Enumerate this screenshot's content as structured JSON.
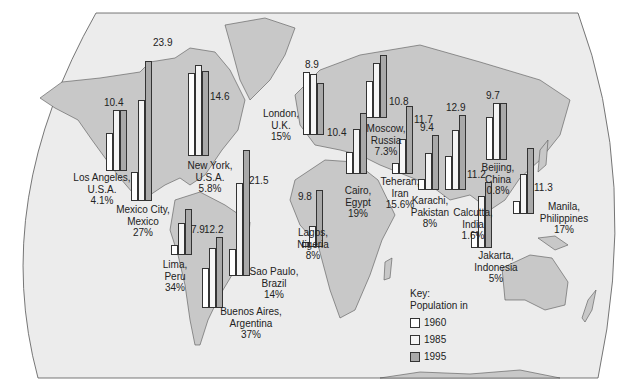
{
  "key": {
    "title": "Key:",
    "subtitle": "Population in",
    "items": [
      {
        "year": "1960",
        "color": "#ffffff"
      },
      {
        "year": "1985",
        "color": "#f4f4f4"
      },
      {
        "year": "1995",
        "color": "#a9a9a9"
      }
    ]
  },
  "cities": [
    {
      "name": "Los Angeles,",
      "country": "U.S.A.",
      "pct": "4.1%",
      "value_1995": "10.4"
    },
    {
      "name": "Mexico City,",
      "country": "Mexico",
      "pct": "27%",
      "value_1995": "23.9"
    },
    {
      "name": "New York,",
      "country": "U.S.A.",
      "pct": "5.8%",
      "value_1995": "14.6"
    },
    {
      "name": "Lima,",
      "country": "Peru",
      "pct": "34%",
      "value_1995": "7.9"
    },
    {
      "name": "Buenos Aires,",
      "country": "Argentina",
      "pct": "37%",
      "value_1995": "12.2"
    },
    {
      "name": "Sao Paulo,",
      "country": "Brazil",
      "pct": "14%",
      "value_1995": "21.5"
    },
    {
      "name": "London,",
      "country": "U.K.",
      "pct": "15%",
      "value_1995": "8.9"
    },
    {
      "name": "Lagos,",
      "country": "Nigeria",
      "pct": "8%",
      "value_1995": "9.8"
    },
    {
      "name": "Cairo,",
      "country": "Egypt",
      "pct": "19%",
      "value_1995": "10.4"
    },
    {
      "name": "Moscow,",
      "country": "Russia",
      "pct": "7.3%",
      "value_1995": "10.8"
    },
    {
      "name": "Teheran,",
      "country": "Iran",
      "pct": "15.6%",
      "value_1995": "11.7"
    },
    {
      "name": "Karachi,",
      "country": "Pakistan",
      "pct": "8%",
      "value_1995": "9.4"
    },
    {
      "name": "Calcutta,",
      "country": "India",
      "pct": "1.6%",
      "value_1995": "12.9"
    },
    {
      "name": "Beijing,",
      "country": "China",
      "pct": "0.8%",
      "value_1995": "9.7"
    },
    {
      "name": "Jakarta,",
      "country": "Indonesia",
      "pct": "5%",
      "value_1995": "11.2"
    },
    {
      "name": "Manila,",
      "country": "Philippines",
      "pct": "17%",
      "value_1995": "11.3"
    }
  ],
  "chart_data": {
    "type": "bar",
    "title": "",
    "xlabel": "",
    "ylabel": "Population (millions)",
    "legend_title": "Key: Population in",
    "legend_position": "bottom-right",
    "categories": [
      "Los Angeles, U.S.A.",
      "Mexico City, Mexico",
      "New York, U.S.A.",
      "Lima, Peru",
      "Buenos Aires, Argentina",
      "Sao Paulo, Brazil",
      "London, U.K.",
      "Lagos, Nigeria",
      "Cairo, Egypt",
      "Moscow, Russia",
      "Teheran, Iran",
      "Karachi, Pakistan",
      "Calcutta, India",
      "Beijing, China",
      "Jakarta, Indonesia",
      "Manila, Philippines"
    ],
    "series": [
      {
        "name": "1960",
        "values": [
          6.5,
          4.9,
          14.2,
          1.7,
          6.8,
          4.7,
          10.7,
          0.8,
          3.7,
          6.3,
          1.9,
          1.8,
          5.8,
          7.3,
          2.7,
          2.3
        ]
      },
      {
        "name": "1985",
        "values": [
          10.4,
          17.3,
          15.6,
          5.5,
          10.3,
          15.9,
          10.5,
          3.6,
          7.7,
          9.4,
          6.0,
          6.3,
          10.2,
          9.7,
          8.9,
          6.9
        ]
      },
      {
        "name": "1995",
        "values": [
          10.4,
          23.9,
          14.6,
          7.9,
          12.2,
          21.5,
          8.9,
          9.8,
          10.4,
          10.8,
          11.7,
          9.4,
          12.9,
          9.7,
          11.2,
          11.3
        ]
      }
    ],
    "annotations": [
      "Percentage under each city: 4.1%, 27%, 5.8%, 34%, 37%, 14%, 15%, 8%, 19%, 7.3%, 15.6%, 8%, 1.6%, 0.8%, 5%, 17%"
    ],
    "grid": false
  }
}
